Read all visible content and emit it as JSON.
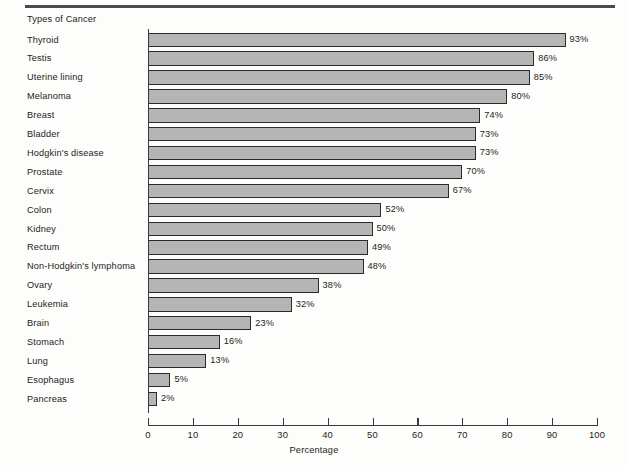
{
  "chart_data": {
    "type": "bar",
    "orientation": "horizontal",
    "title": "",
    "axis_header": "Types of Cancer",
    "xlabel": "Percentage",
    "ylabel": "",
    "xlim": [
      0,
      100
    ],
    "xticks": [
      0,
      10,
      20,
      30,
      40,
      50,
      60,
      70,
      80,
      90,
      100
    ],
    "xtick_labels": [
      "0",
      "10",
      "20",
      "30",
      "40",
      "50",
      "60",
      "70",
      "80",
      "90",
      "100"
    ],
    "grid": false,
    "legend": false,
    "value_suffix": "%",
    "categories": [
      "Thyroid",
      "Testis",
      "Uterine lining",
      "Melanoma",
      "Breast",
      "Bladder",
      "Hodgkin's disease",
      "Prostate",
      "Cervix",
      "Colon",
      "Kidney",
      "Rectum",
      "Non-Hodgkin's lymphoma",
      "Ovary",
      "Leukemia",
      "Brain",
      "Stomach",
      "Lung",
      "Esophagus",
      "Pancreas"
    ],
    "values": [
      93,
      86,
      85,
      80,
      74,
      73,
      73,
      70,
      67,
      52,
      50,
      49,
      48,
      38,
      32,
      23,
      16,
      13,
      5,
      2
    ],
    "value_labels": [
      "93%",
      "86%",
      "85%",
      "80%",
      "74%",
      "73%",
      "73%",
      "70%",
      "67%",
      "52%",
      "50%",
      "49%",
      "48%",
      "38%",
      "32%",
      "23%",
      "16%",
      "13%",
      "5%",
      "2%"
    ],
    "colors": {
      "bar_fill": "#b5b5b5",
      "bar_border": "#2b2b2b",
      "axis": "#3a3a3a",
      "text": "#1c1c1c",
      "rule": "#4a4a4a",
      "background": "#fdfdfb"
    }
  }
}
